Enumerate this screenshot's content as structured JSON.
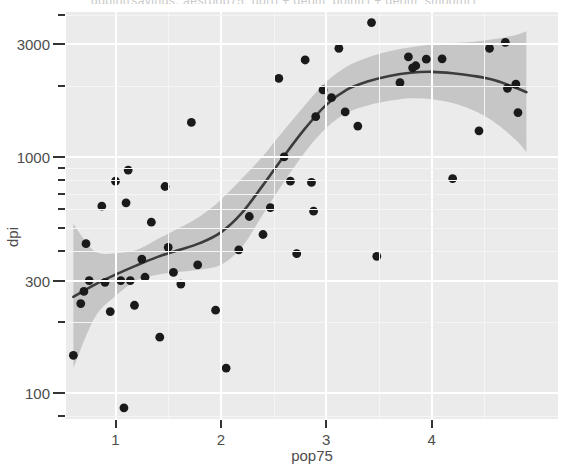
{
  "chart_data": {
    "type": "scatter",
    "title": "ggplot(savings, aes(pop75, dpi)) + geom_point() + geom_smooth()",
    "xlabel": "pop75",
    "ylabel": "dpi",
    "xlim": [
      0.53,
      5.2
    ],
    "ylim": [
      78,
      4100
    ],
    "yscale": "log10",
    "xscale": "linear",
    "grid": true,
    "legend": "none",
    "x_ticks": [
      1,
      2,
      3,
      4
    ],
    "x_tick_labels": [
      "1",
      "2",
      "3",
      "4"
    ],
    "y_ticks": [
      100,
      300,
      1000,
      3000
    ],
    "y_tick_labels": [
      "100",
      "300",
      "1000",
      "3000"
    ],
    "y_minor_ticks": [
      80,
      200,
      400,
      500,
      600,
      700,
      800,
      900,
      2000,
      4000
    ],
    "point_color": "#1a1a1a",
    "line_color": "#3c3c3c",
    "ribbon_color": "#b0b0b0",
    "panel_color": "#ebebeb",
    "grid_color": "#ffffff",
    "points": [
      {
        "x": 0.6,
        "y": 145
      },
      {
        "x": 0.67,
        "y": 240
      },
      {
        "x": 0.7,
        "y": 270
      },
      {
        "x": 0.72,
        "y": 430
      },
      {
        "x": 0.75,
        "y": 300
      },
      {
        "x": 0.87,
        "y": 620
      },
      {
        "x": 0.9,
        "y": 295
      },
      {
        "x": 0.95,
        "y": 222
      },
      {
        "x": 1.0,
        "y": 790
      },
      {
        "x": 1.05,
        "y": 300
      },
      {
        "x": 1.08,
        "y": 87
      },
      {
        "x": 1.1,
        "y": 640
      },
      {
        "x": 1.12,
        "y": 880
      },
      {
        "x": 1.14,
        "y": 300
      },
      {
        "x": 1.18,
        "y": 236
      },
      {
        "x": 1.25,
        "y": 370
      },
      {
        "x": 1.28,
        "y": 310
      },
      {
        "x": 1.34,
        "y": 530
      },
      {
        "x": 1.42,
        "y": 173
      },
      {
        "x": 1.47,
        "y": 750
      },
      {
        "x": 1.5,
        "y": 415
      },
      {
        "x": 1.55,
        "y": 325
      },
      {
        "x": 1.62,
        "y": 290
      },
      {
        "x": 1.72,
        "y": 1400
      },
      {
        "x": 1.78,
        "y": 350
      },
      {
        "x": 1.95,
        "y": 225
      },
      {
        "x": 2.05,
        "y": 128
      },
      {
        "x": 2.17,
        "y": 405
      },
      {
        "x": 2.27,
        "y": 560
      },
      {
        "x": 2.4,
        "y": 470
      },
      {
        "x": 2.47,
        "y": 610
      },
      {
        "x": 2.55,
        "y": 2150
      },
      {
        "x": 2.6,
        "y": 1000
      },
      {
        "x": 2.66,
        "y": 790
      },
      {
        "x": 2.72,
        "y": 390
      },
      {
        "x": 2.8,
        "y": 2570
      },
      {
        "x": 2.86,
        "y": 780
      },
      {
        "x": 2.88,
        "y": 590
      },
      {
        "x": 2.9,
        "y": 1480
      },
      {
        "x": 2.97,
        "y": 1920
      },
      {
        "x": 3.05,
        "y": 1780
      },
      {
        "x": 3.12,
        "y": 2880
      },
      {
        "x": 3.18,
        "y": 1550
      },
      {
        "x": 3.3,
        "y": 1350
      },
      {
        "x": 3.43,
        "y": 3700
      },
      {
        "x": 3.48,
        "y": 380
      },
      {
        "x": 3.7,
        "y": 2060
      },
      {
        "x": 3.78,
        "y": 2650
      },
      {
        "x": 3.82,
        "y": 2380
      },
      {
        "x": 3.85,
        "y": 2430
      },
      {
        "x": 3.95,
        "y": 2590
      },
      {
        "x": 4.1,
        "y": 2600
      },
      {
        "x": 4.2,
        "y": 810
      },
      {
        "x": 4.45,
        "y": 1290
      },
      {
        "x": 4.55,
        "y": 2880
      },
      {
        "x": 4.7,
        "y": 3050
      },
      {
        "x": 4.72,
        "y": 1950
      },
      {
        "x": 4.8,
        "y": 2030
      },
      {
        "x": 4.82,
        "y": 1540
      }
    ],
    "smooth_line": [
      {
        "x": 0.6,
        "y": 256
      },
      {
        "x": 0.8,
        "y": 288
      },
      {
        "x": 1.0,
        "y": 318
      },
      {
        "x": 1.2,
        "y": 348
      },
      {
        "x": 1.4,
        "y": 378
      },
      {
        "x": 1.6,
        "y": 404
      },
      {
        "x": 1.8,
        "y": 432
      },
      {
        "x": 2.0,
        "y": 480
      },
      {
        "x": 2.2,
        "y": 580
      },
      {
        "x": 2.4,
        "y": 760
      },
      {
        "x": 2.6,
        "y": 1010
      },
      {
        "x": 2.8,
        "y": 1320
      },
      {
        "x": 3.0,
        "y": 1660
      },
      {
        "x": 3.2,
        "y": 1930
      },
      {
        "x": 3.4,
        "y": 2090
      },
      {
        "x": 3.6,
        "y": 2200
      },
      {
        "x": 3.8,
        "y": 2270
      },
      {
        "x": 4.0,
        "y": 2290
      },
      {
        "x": 4.2,
        "y": 2260
      },
      {
        "x": 4.4,
        "y": 2200
      },
      {
        "x": 4.6,
        "y": 2110
      },
      {
        "x": 4.8,
        "y": 1960
      },
      {
        "x": 4.9,
        "y": 1880
      }
    ],
    "smooth_ci_upper": [
      {
        "x": 0.6,
        "y": 520
      },
      {
        "x": 0.8,
        "y": 400
      },
      {
        "x": 1.0,
        "y": 392
      },
      {
        "x": 1.2,
        "y": 404
      },
      {
        "x": 1.4,
        "y": 450
      },
      {
        "x": 1.6,
        "y": 500
      },
      {
        "x": 1.8,
        "y": 560
      },
      {
        "x": 2.0,
        "y": 660
      },
      {
        "x": 2.2,
        "y": 810
      },
      {
        "x": 2.4,
        "y": 1010
      },
      {
        "x": 2.6,
        "y": 1300
      },
      {
        "x": 2.8,
        "y": 1660
      },
      {
        "x": 3.0,
        "y": 2080
      },
      {
        "x": 3.2,
        "y": 2420
      },
      {
        "x": 3.4,
        "y": 2640
      },
      {
        "x": 3.6,
        "y": 2800
      },
      {
        "x": 3.8,
        "y": 2910
      },
      {
        "x": 4.0,
        "y": 2990
      },
      {
        "x": 4.2,
        "y": 3030
      },
      {
        "x": 4.4,
        "y": 3070
      },
      {
        "x": 4.6,
        "y": 3150
      },
      {
        "x": 4.8,
        "y": 3280
      },
      {
        "x": 4.9,
        "y": 3400
      }
    ],
    "smooth_ci_lower": [
      {
        "x": 0.6,
        "y": 128
      },
      {
        "x": 0.8,
        "y": 208
      },
      {
        "x": 1.0,
        "y": 258
      },
      {
        "x": 1.2,
        "y": 300
      },
      {
        "x": 1.4,
        "y": 318
      },
      {
        "x": 1.6,
        "y": 326
      },
      {
        "x": 1.8,
        "y": 334
      },
      {
        "x": 2.0,
        "y": 350
      },
      {
        "x": 2.2,
        "y": 416
      },
      {
        "x": 2.4,
        "y": 572
      },
      {
        "x": 2.6,
        "y": 785
      },
      {
        "x": 2.8,
        "y": 1050
      },
      {
        "x": 3.0,
        "y": 1325
      },
      {
        "x": 3.2,
        "y": 1540
      },
      {
        "x": 3.4,
        "y": 1655
      },
      {
        "x": 3.6,
        "y": 1728
      },
      {
        "x": 3.8,
        "y": 1770
      },
      {
        "x": 4.0,
        "y": 1755
      },
      {
        "x": 4.2,
        "y": 1690
      },
      {
        "x": 4.4,
        "y": 1570
      },
      {
        "x": 4.6,
        "y": 1400
      },
      {
        "x": 4.8,
        "y": 1180
      },
      {
        "x": 4.9,
        "y": 1050
      }
    ]
  }
}
